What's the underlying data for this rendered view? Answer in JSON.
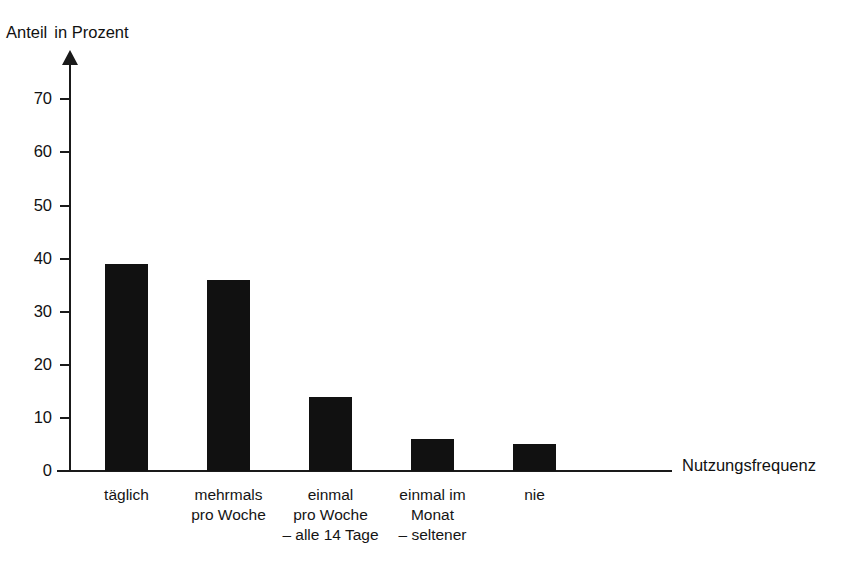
{
  "chart_data": {
    "type": "bar",
    "title": "",
    "xlabel": "Nutzungsfrequenz",
    "ylabel": "Anteil in Prozent",
    "categories": [
      "täglich",
      "mehrmals\npro Woche",
      "einmal\npro Woche\n– alle 14 Tage",
      "einmal im\nMonat\n– seltener",
      "nie"
    ],
    "values": [
      39,
      36,
      14,
      6,
      5
    ],
    "ylim": [
      0,
      75
    ],
    "yticks": [
      0,
      10,
      20,
      30,
      40,
      50,
      60,
      70
    ],
    "ytick_labels": [
      "0",
      "10",
      "20",
      "30",
      "40",
      "50",
      "60",
      "70"
    ],
    "grid": false,
    "legend": "none",
    "bar_color": "#111111",
    "background_color": "#ffffff"
  },
  "axes": {
    "y_title_part1": "Anteil",
    "y_title_part2": "in Prozent",
    "x_title": "Nutzungsfrequenz"
  }
}
